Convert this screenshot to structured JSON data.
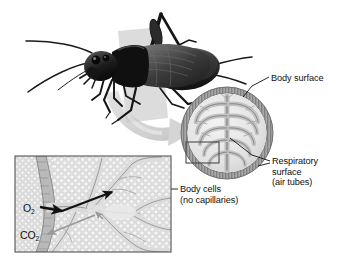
{
  "figure": {
    "type": "biology-diagram",
    "background_color": "#ffffff"
  },
  "labels": {
    "body_surface": "Body surface",
    "respiratory_line1": "Respiratory",
    "respiratory_line2": "surface",
    "respiratory_line3": "(air tubes)",
    "body_cells_line1": "Body cells",
    "body_cells_line2": "(no capillaries)",
    "oxygen": "O",
    "oxygen_sub": "2",
    "carbon_dioxide": "CO",
    "carbon_dioxide_sub": "2"
  },
  "panels": {
    "organism": {
      "name": "cricket-photo",
      "description": "dark cricket insect on pale gray plane"
    },
    "cross_section": {
      "name": "body-cross-section",
      "description": "circular cross section of insect body with hatched cuticle ring and branching air tubes"
    },
    "inset": {
      "name": "tissue-inset",
      "description": "magnified view of body cells and air tube with gas exchange arrows"
    },
    "callout_rect": {
      "name": "callout-rectangle"
    },
    "zoom_arrow": {
      "name": "magnify-arrow"
    }
  },
  "colors": {
    "ink": "#111111",
    "line": "#1a1a1a",
    "arrow_dark": "#111111",
    "arrow_light": "#9a9a9a",
    "ring_gray": "#8d8d8d",
    "tissue_gray": "#c9c9c9",
    "pale_gray": "#e3e3e3",
    "plane_gray": "#d3d3d3",
    "box_border": "#555555"
  }
}
